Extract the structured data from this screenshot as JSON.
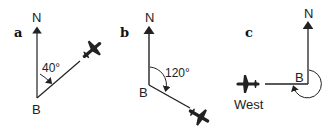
{
  "panels": [
    {
      "id": "a",
      "label": "a",
      "north": "N",
      "point": "B",
      "angle": "40°"
    },
    {
      "id": "b",
      "label": "b",
      "north": "N",
      "point": "B",
      "angle": "120°"
    },
    {
      "id": "c",
      "label": "c",
      "north": "N",
      "point": "B",
      "direction": "West"
    }
  ],
  "colors": {
    "ink": "#222222",
    "background": "#ffffff"
  }
}
